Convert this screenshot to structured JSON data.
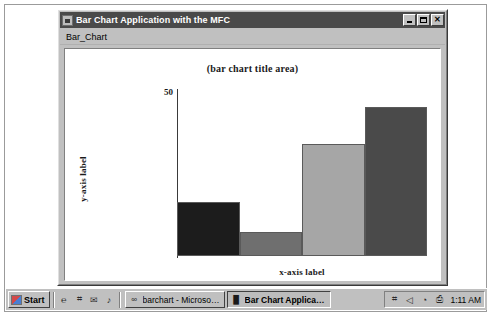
{
  "window": {
    "title": "Bar Chart Application with the MFC",
    "icon": "app-icon",
    "controls": {
      "minimize": "minimize-icon",
      "maximize": "maximize-icon",
      "close": "close-icon",
      "close_glyph": "✕"
    },
    "menu": [
      {
        "label": "Bar_Chart"
      }
    ]
  },
  "chart_data": {
    "type": "bar",
    "title": "(bar chart title area)",
    "xlabel": "x-axis label",
    "ylabel": "y-axis label",
    "categories": [
      "1",
      "2",
      "3",
      "4"
    ],
    "values": [
      16,
      7,
      33,
      44
    ],
    "ylim": [
      0,
      50
    ],
    "yticks": [
      50
    ],
    "ytick_labels": [
      "50"
    ],
    "grid": false,
    "legend": false,
    "bar_colors": [
      "#1c1c1c",
      "#6f6f6f",
      "#a6a6a6",
      "#4a4a4a"
    ],
    "bar_border": "#5a5a5a",
    "plot_background": "#ffffff",
    "axis_color": "#3a3a3a"
  },
  "taskbar": {
    "start": {
      "label": "Start",
      "icon": "windows-flag-icon"
    },
    "quick_launch": [
      {
        "name": "internet-explorer-icon",
        "glyph": "℮"
      },
      {
        "name": "show-desktop-icon",
        "glyph": "⌗"
      },
      {
        "name": "outlook-express-icon",
        "glyph": "✉"
      },
      {
        "name": "media-player-icon",
        "glyph": "♪"
      }
    ],
    "tasks": [
      {
        "label": "barchart - Microsoft Devel...",
        "icon": "visual-studio-icon",
        "glyph": "∞",
        "active": false
      },
      {
        "label": "Bar Chart Application...",
        "icon": "app-icon",
        "glyph": "█",
        "active": true
      }
    ],
    "tray": {
      "icons": [
        {
          "name": "network-icon",
          "glyph": "⌗"
        },
        {
          "name": "volume-icon",
          "glyph": "◁"
        },
        {
          "name": "clock-tray-icon",
          "glyph": "◔"
        },
        {
          "name": "printer-icon",
          "glyph": "⎙"
        }
      ],
      "clock": "1:11 AM"
    }
  }
}
